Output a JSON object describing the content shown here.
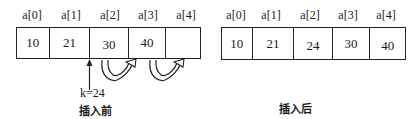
{
  "before": {
    "indices": [
      "a[0]",
      "a[1]",
      "a[2]",
      "a[3]",
      "a[4]"
    ],
    "values": [
      "10",
      "21",
      "30",
      "40",
      ""
    ],
    "insert_key": "k=24",
    "caption": "插入前"
  },
  "after": {
    "indices": [
      "a[0]",
      "a[1]",
      "a[2]",
      "a[3]",
      "a[4]"
    ],
    "values": [
      "10",
      "21",
      "24",
      "30",
      "40"
    ],
    "caption": "插入后"
  }
}
